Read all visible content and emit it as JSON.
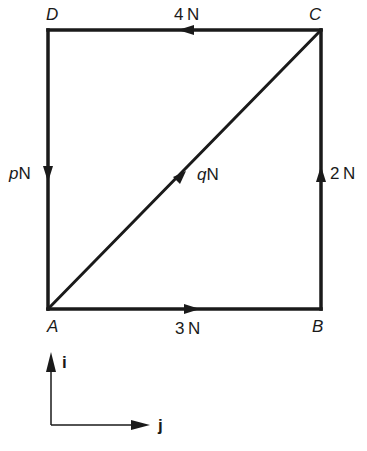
{
  "diagram": {
    "vertices": {
      "A": {
        "label": "A",
        "x": 48,
        "y": 309
      },
      "B": {
        "label": "B",
        "x": 321,
        "y": 309
      },
      "C": {
        "label": "C",
        "x": 321,
        "y": 30
      },
      "D": {
        "label": "D",
        "x": 48,
        "y": 30
      }
    },
    "forces": {
      "CD": {
        "magnitude": "4",
        "unit": "N",
        "direction": "C to D"
      },
      "DA": {
        "magnitude": "p",
        "unit": "N",
        "direction": "D to A"
      },
      "AC": {
        "magnitude": "q",
        "unit": "N",
        "direction": "A to C"
      },
      "BC": {
        "magnitude": "2",
        "unit": "N",
        "direction": "B to C"
      },
      "AB": {
        "magnitude": "3",
        "unit": "N",
        "direction": "A to B"
      }
    },
    "axes": {
      "vertical": {
        "label": "i"
      },
      "horizontal": {
        "label": "j"
      }
    },
    "line_color": "#1a1a1a"
  }
}
